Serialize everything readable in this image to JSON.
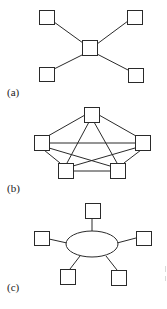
{
  "figure": {
    "panels": [
      {
        "id": "a",
        "label": "(a)",
        "topology": "star",
        "hub": {
          "x": 82,
          "y": 40,
          "w": 15,
          "h": 15
        },
        "nodes": [
          {
            "x": 39,
            "y": 10,
            "w": 15,
            "h": 14
          },
          {
            "x": 127,
            "y": 10,
            "w": 15,
            "h": 14
          },
          {
            "x": 39,
            "y": 67,
            "w": 15,
            "h": 14
          },
          {
            "x": 128,
            "y": 68,
            "w": 15,
            "h": 14
          }
        ]
      },
      {
        "id": "b",
        "label": "(b)",
        "topology": "fully-connected mesh",
        "nodes": [
          {
            "x": 84,
            "y": 107,
            "w": 15,
            "h": 15
          },
          {
            "x": 34,
            "y": 135,
            "w": 15,
            "h": 15
          },
          {
            "x": 135,
            "y": 135,
            "w": 15,
            "h": 15
          },
          {
            "x": 58,
            "y": 163,
            "w": 15,
            "h": 15
          },
          {
            "x": 110,
            "y": 163,
            "w": 15,
            "h": 15
          }
        ]
      },
      {
        "id": "c",
        "label": "(c)",
        "topology": "bus / shared medium",
        "hub": {
          "cx": 92,
          "cy": 244,
          "rx": 26,
          "ry": 13
        },
        "nodes": [
          {
            "x": 85,
            "y": 203,
            "w": 15,
            "h": 15
          },
          {
            "x": 34,
            "y": 231,
            "w": 15,
            "h": 14
          },
          {
            "x": 136,
            "y": 231,
            "w": 15,
            "h": 14
          },
          {
            "x": 60,
            "y": 269,
            "w": 15,
            "h": 15
          },
          {
            "x": 111,
            "y": 270,
            "w": 15,
            "h": 15
          }
        ]
      }
    ],
    "colors": {
      "stroke": "#2a2a2a",
      "background": "#ffffff"
    }
  }
}
